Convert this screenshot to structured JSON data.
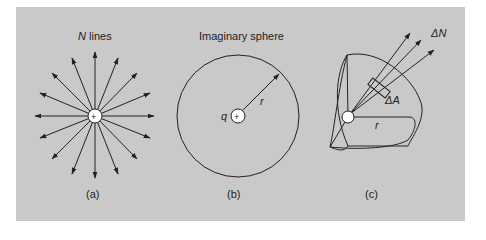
{
  "figure": {
    "panel_a": {
      "title_var": "N",
      "title_rest": " lines",
      "caption": "(a)",
      "charge_sign": "+"
    },
    "panel_b": {
      "title": "Imaginary sphere",
      "charge_label": "q",
      "radius_label": "r",
      "caption": "(b)",
      "charge_sign": "+"
    },
    "panel_c": {
      "flux_label": "ΔN",
      "area_label": "ΔA",
      "radius_label": "r",
      "caption": "(c)"
    },
    "colors": {
      "background": "#c9c9c9",
      "ink": "#222222",
      "charge_fill": "#ffffff"
    }
  }
}
